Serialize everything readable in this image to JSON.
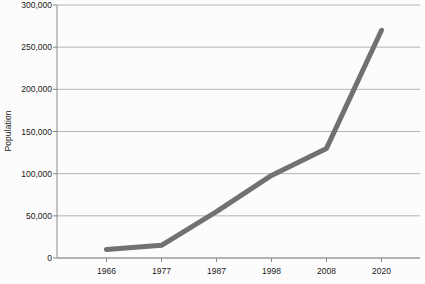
{
  "chart_data": {
    "type": "line",
    "title": "",
    "xlabel": "",
    "ylabel": "Population",
    "categories": [
      "1966",
      "1977",
      "1987",
      "1998",
      "2008",
      "2020"
    ],
    "x": [
      1966,
      1977,
      1987,
      1998,
      2008,
      2020
    ],
    "values": [
      10000,
      15000,
      55000,
      98000,
      130000,
      270000
    ],
    "series": [
      {
        "name": "Population",
        "values": [
          10000,
          15000,
          55000,
          98000,
          130000,
          270000
        ]
      }
    ],
    "ylim": [
      0,
      300000
    ],
    "yticks": [
      0,
      50000,
      100000,
      150000,
      200000,
      250000,
      300000
    ],
    "ytick_labels": [
      "0",
      "50,000",
      "100,000",
      "150,000",
      "200,000",
      "250,000",
      "300,000"
    ],
    "xtick_labels": [
      "1966",
      "1977",
      "1987",
      "1998",
      "2008",
      "2020"
    ],
    "grid": "horizontal",
    "legend": "none",
    "line_color": "#717171",
    "line_width": 5,
    "gridline_color": "#b4b4b4",
    "axis_color": "#808080",
    "background_color": "#fcfcfc"
  }
}
